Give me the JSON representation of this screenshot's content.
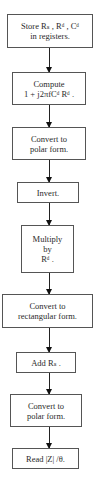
{
  "flowchart": {
    "steps": [
      {
        "id": "store",
        "lines": [
          "Store Rₛ , Rᵈ , Cᵈ",
          "in registers."
        ]
      },
      {
        "id": "compute",
        "lines": [
          "Compute",
          "1 + j2πfCᵈ Rᵈ ."
        ]
      },
      {
        "id": "convert-polar-1",
        "lines": [
          "Convert to",
          "polar form."
        ]
      },
      {
        "id": "invert",
        "lines": [
          "Invert."
        ]
      },
      {
        "id": "multiply",
        "lines": [
          "Multiply",
          "by",
          "Rᵈ ."
        ]
      },
      {
        "id": "convert-rect",
        "lines": [
          "Convert to",
          "rectangular form."
        ]
      },
      {
        "id": "add",
        "lines": [
          "Add Rₛ ."
        ]
      },
      {
        "id": "convert-polar-2",
        "lines": [
          "Convert to",
          "polar form."
        ]
      },
      {
        "id": "read",
        "lines": [
          "Read |Z| /θ."
        ]
      }
    ]
  },
  "colors": {
    "border": "#555555",
    "arrow": "#111111",
    "text": "#2a2a2a",
    "background": "#ffffff"
  }
}
